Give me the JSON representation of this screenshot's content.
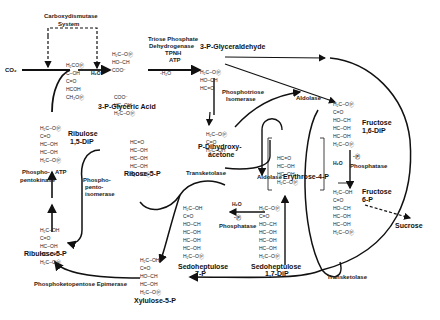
{
  "labels": {
    "carboxydismutase": "Carboxydismutase",
    "system": "System",
    "co2": "CO₂",
    "h2o_in": "H₂O",
    "glyceric_acid": "3-P-Glyceric Acid",
    "glyceraldehyde": "3-P-Glyceraldehyde",
    "triose_dh_1": "Triose Phosphate",
    "triose_dh_2": "Dehydrogenase",
    "tpnh": "TPNH",
    "atp": "ATP",
    "minus_h2o": "-H₂O",
    "phosphotriose_1": "Phosphotriose",
    "phosphotriose_2": "Isomerase",
    "dhap_1": "P-Dihydroxy-",
    "dhap_2": "acetone",
    "aldolase_top": "Aldolase",
    "aldolase_mid": "Aldolase",
    "erythrose": "Erythrose-4-P",
    "fructose_dip_1": "Fructose",
    "fructose_dip_2": "1,6-DiP",
    "phosphatase_right": "Phosphatase",
    "fructose_6p_1": "Fructose",
    "fructose_6p_2": "6-P",
    "sucrose": "Sucrose",
    "ribulose_dip_1": "Ribulose",
    "ribulose_dip_2": "1,5-DiP",
    "phosphopentokinase_1": "Phospho-",
    "phosphopentokinase_2": "pentokinase",
    "atp_left": "ATP",
    "phosphopento_1": "Phospho-",
    "phosphopento_2": "pento-",
    "phosphopento_3": "isomerase",
    "ribose": "Ribose-5-P",
    "transketolase_mid": "Transketolase",
    "phosphatase_mid": "Phosphatase",
    "sedo_7p_1": "Sedoheptulose",
    "sedo_7p_2": "7-P",
    "sedo_dip_1": "Sedoheptulose",
    "sedo_dip_2": "1,7-DiP",
    "ribulose_5p": "Ribulose-5-P",
    "epimerase": "Phosphoketopentose Epimerase",
    "xylulose": "Xylulose-5-P",
    "transketolase_bottom": "Transketolase",
    "h2o_right": "H₂O",
    "minus_p_right": "-Ⓟ",
    "h2o_mid": "H₂O",
    "minus_p_mid": "-Ⓟ"
  },
  "structures": {
    "intermediate": [
      "H₂COⓅ",
      "C–OH",
      "C=O",
      "HCOH",
      "CH₂OⓅ"
    ],
    "pga_top": [
      "H₂C–OⓅ",
      "HO–CH",
      "COO⁻"
    ],
    "pga_bottom": [
      "COO⁻",
      "HC–OH",
      "H₂C–OⓅ"
    ],
    "gap": [
      "H₂C–OⓅ",
      "HO–CH",
      "HC=O"
    ],
    "dhap": [
      "H₂C–OⓅ",
      "C=O",
      "H₂C–OH"
    ],
    "fdp": [
      "H₂C–OⓅ",
      "C=O",
      "HO–CH",
      "HC–OH",
      "HC–OH",
      "H₂C–OⓅ"
    ],
    "f6p": [
      "H₂C–OH",
      "C=O",
      "HO–CH",
      "HC–OH",
      "HC–OH",
      "H₂C–OⓅ"
    ],
    "e4p": [
      "HC=O",
      "HC–OH",
      "HC–OH",
      "H₂C–OⓅ"
    ],
    "rudp": [
      "H₂C–OⓅ",
      "C=O",
      "HC–OH",
      "HC–OH",
      "H₂C–OⓅ"
    ],
    "r5p": [
      "HC=O",
      "HC–OH",
      "HC–OH",
      "HC–OH",
      "H₂C–OⓅ"
    ],
    "ru5p": [
      "H₂C–OH",
      "C=O",
      "HC–OH",
      "HC–OH",
      "H₂C–OⓅ"
    ],
    "s7p": [
      "H₂C–OH",
      "C=O",
      "HO–CH",
      "HC–OH",
      "HC–OH",
      "HC–OH",
      "H₂C–OⓅ"
    ],
    "sdp": [
      "H₂C–OⓅ",
      "C=O",
      "HO–CH",
      "HC–OH",
      "HC–OH",
      "HC–OH",
      "H₂C–OⓅ"
    ],
    "x5p": [
      "H₂C–OH",
      "C=O",
      "HO–CH",
      "HC–OH",
      "H₂C–OⓅ"
    ]
  },
  "colors": {
    "ink": "#111111",
    "background": "#ffffff"
  }
}
